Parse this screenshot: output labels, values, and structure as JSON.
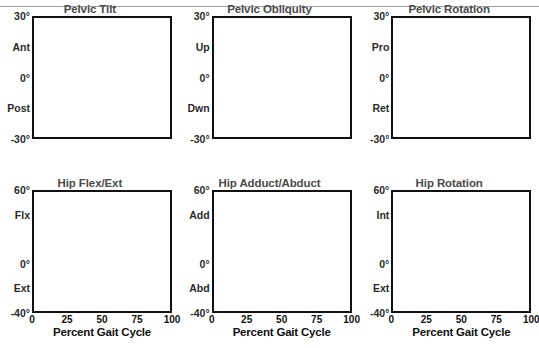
{
  "figure": {
    "title_bar_visible": true,
    "background": "#ffffff",
    "band_color": "#8c8c8c",
    "band_edge_color": "#6e6e6e",
    "mean_line_color": "#555555",
    "patient_line_color": "#111111",
    "grid_color": "#b4b4b4",
    "zero_line_color": "#111111",
    "event_line_solid_color": "#8a8a8a",
    "event_line_dashed_color": "#777777",
    "axis_color": "#111111",
    "title_color": "#4a4a4a"
  },
  "xaxis": {
    "title": "Percent Gait Cycle",
    "ticks": [
      0,
      25,
      50,
      75,
      100
    ],
    "tick_labels": [
      "0",
      "25",
      "50",
      "75",
      "100"
    ],
    "min": 0,
    "max": 100
  },
  "events": {
    "solid_vertical_pct": 62,
    "dashed_vertical_pct": 64.5,
    "top_marks_pct": [
      15,
      17,
      49,
      51
    ]
  },
  "chart_data": [
    {
      "type": "line",
      "title": "Pelvic Tilt",
      "xlabel": "Percent Gait Cycle",
      "ylabel": "",
      "ylim": [
        -30,
        30
      ],
      "yticks": [
        -30,
        -15,
        0,
        15,
        30
      ],
      "ytick_labels": [
        "-30°",
        "Post",
        "0°",
        "Ant",
        "30°"
      ],
      "grid": true,
      "x": [
        0,
        5,
        10,
        15,
        20,
        25,
        30,
        35,
        40,
        45,
        50,
        55,
        60,
        65,
        70,
        75,
        80,
        85,
        90,
        95,
        100
      ],
      "series": [
        {
          "name": "Normal band upper",
          "values": [
            14.5,
            14.5,
            14.3,
            14.0,
            13.6,
            13.2,
            13.0,
            13.0,
            13.2,
            13.5,
            13.8,
            14.0,
            14.2,
            14.5,
            14.8,
            15.0,
            15.0,
            14.8,
            14.6,
            14.5,
            14.5
          ]
        },
        {
          "name": "Normal band lower",
          "values": [
            7.0,
            7.0,
            6.8,
            6.5,
            6.2,
            6.0,
            5.9,
            5.9,
            6.0,
            6.2,
            6.4,
            6.6,
            6.8,
            7.0,
            7.2,
            7.4,
            7.4,
            7.3,
            7.1,
            7.0,
            7.0
          ]
        },
        {
          "name": "Mean",
          "values": [
            11.0,
            11.0,
            10.7,
            10.3,
            10.0,
            9.7,
            9.5,
            9.5,
            9.7,
            10.0,
            10.2,
            10.4,
            10.6,
            10.9,
            11.1,
            11.3,
            11.3,
            11.2,
            11.0,
            11.0,
            11.0
          ]
        },
        {
          "name": "Patient (dash-dot)",
          "values": [
            12.5,
            12.6,
            12.3,
            11.9,
            11.5,
            11.2,
            11.0,
            11.0,
            11.2,
            11.5,
            11.8,
            12.1,
            12.4,
            12.7,
            12.9,
            13.0,
            12.9,
            12.7,
            12.5,
            12.4,
            12.4
          ]
        }
      ]
    },
    {
      "type": "line",
      "title": "Pelvic Obliquity",
      "xlabel": "Percent Gait Cycle",
      "ylabel": "",
      "ylim": [
        -30,
        30
      ],
      "yticks": [
        -30,
        -15,
        0,
        15,
        30
      ],
      "ytick_labels": [
        "-30°",
        "Dwn",
        "0°",
        "Up",
        "30°"
      ],
      "grid": true,
      "x": [
        0,
        5,
        10,
        15,
        20,
        25,
        30,
        35,
        40,
        45,
        50,
        55,
        60,
        65,
        70,
        75,
        80,
        85,
        90,
        95,
        100
      ],
      "series": [
        {
          "name": "Normal band upper",
          "values": [
            2.0,
            2.2,
            2.0,
            1.3,
            0.4,
            -0.4,
            -1.0,
            -1.2,
            -0.9,
            -0.4,
            0.0,
            -0.6,
            -1.8,
            -3.0,
            -3.4,
            -2.6,
            -1.2,
            0.0,
            0.6,
            0.9,
            1.0
          ]
        },
        {
          "name": "Normal band lower",
          "values": [
            -0.8,
            -0.6,
            -0.9,
            -1.5,
            -2.3,
            -3.0,
            -3.5,
            -3.7,
            -3.4,
            -2.9,
            -2.6,
            -3.2,
            -4.4,
            -5.6,
            -6.0,
            -5.2,
            -3.8,
            -2.4,
            -1.7,
            -1.3,
            -1.2
          ]
        },
        {
          "name": "Mean",
          "values": [
            0.6,
            0.8,
            0.6,
            -0.1,
            -1.0,
            -1.7,
            -2.3,
            -2.5,
            -2.2,
            -1.7,
            -1.3,
            -1.9,
            -3.1,
            -4.3,
            -4.7,
            -3.9,
            -2.5,
            -1.2,
            -0.6,
            -0.2,
            -0.1
          ]
        },
        {
          "name": "Patient (dash-dot)",
          "values": [
            2.4,
            3.0,
            2.8,
            2.0,
            1.0,
            0.1,
            -0.6,
            -0.9,
            -0.6,
            -0.1,
            0.3,
            -0.4,
            -1.8,
            -3.2,
            -3.6,
            -2.7,
            -1.0,
            0.4,
            1.0,
            1.2,
            1.2
          ]
        }
      ]
    },
    {
      "type": "line",
      "title": "Pelvic Rotation",
      "xlabel": "Percent Gait Cycle",
      "ylabel": "",
      "ylim": [
        -30,
        30
      ],
      "yticks": [
        -30,
        -15,
        0,
        15,
        30
      ],
      "ytick_labels": [
        "-30°",
        "Ret",
        "0°",
        "Pro",
        "30°"
      ],
      "grid": true,
      "x": [
        0,
        5,
        10,
        15,
        20,
        25,
        30,
        35,
        40,
        45,
        50,
        55,
        60,
        65,
        70,
        75,
        80,
        85,
        90,
        95,
        100
      ],
      "series": [
        {
          "name": "Normal band upper",
          "values": [
            8.0,
            7.6,
            6.8,
            5.6,
            4.2,
            2.6,
            0.8,
            -1.2,
            -3.2,
            -4.8,
            -5.8,
            -6.4,
            -6.4,
            -5.6,
            -4.0,
            -1.6,
            1.2,
            4.0,
            6.2,
            7.6,
            8.2
          ]
        },
        {
          "name": "Normal band lower",
          "values": [
            1.5,
            1.0,
            0.2,
            -1.0,
            -2.6,
            -4.6,
            -6.8,
            -9.0,
            -11.0,
            -12.4,
            -13.2,
            -13.6,
            -13.4,
            -12.4,
            -10.4,
            -7.4,
            -4.0,
            -0.6,
            2.2,
            4.2,
            5.2
          ]
        },
        {
          "name": "Mean",
          "values": [
            4.5,
            4.0,
            3.2,
            2.0,
            0.4,
            -1.4,
            -3.4,
            -5.6,
            -7.6,
            -9.0,
            -9.8,
            -10.2,
            -10.0,
            -9.0,
            -7.0,
            -4.0,
            -0.8,
            2.2,
            4.6,
            6.2,
            6.8
          ]
        },
        {
          "name": "Patient (dash-dot)",
          "values": [
            5.0,
            5.4,
            5.6,
            5.4,
            4.8,
            3.8,
            2.6,
            1.4,
            0.4,
            -0.3,
            -0.8,
            -1.0,
            -1.0,
            -0.8,
            -0.4,
            0.4,
            1.6,
            3.0,
            4.2,
            5.0,
            5.4
          ]
        },
        {
          "name": "Patient (solid dark)",
          "values": [
            -0.4,
            -0.4,
            -0.5,
            -0.6,
            -0.8,
            -1.2,
            -2.0,
            -3.4,
            -5.2,
            -7.2,
            -9.0,
            -10.2,
            -10.8,
            -10.2,
            -8.4,
            -6.0,
            -3.8,
            -2.2,
            -1.2,
            -0.7,
            -0.5
          ]
        }
      ]
    },
    {
      "type": "line",
      "title": "Hip Flex/Ext",
      "xlabel": "Percent Gait Cycle",
      "ylabel": "",
      "ylim": [
        -40,
        60
      ],
      "yticks": [
        -40,
        -20,
        0,
        20,
        40,
        60
      ],
      "ytick_labels": [
        "-40°",
        "Ext",
        "0°",
        "",
        "Flx",
        "60°"
      ],
      "grid": true,
      "x": [
        0,
        5,
        10,
        15,
        20,
        25,
        30,
        35,
        40,
        45,
        50,
        55,
        60,
        65,
        70,
        75,
        80,
        85,
        90,
        95,
        100
      ],
      "series": [
        {
          "name": "Normal band upper",
          "values": [
            36,
            36,
            34,
            31,
            27,
            23,
            18,
            13,
            8,
            4,
            1,
            0,
            3,
            11,
            21,
            31,
            38,
            42,
            42,
            40,
            38
          ]
        },
        {
          "name": "Normal band lower",
          "values": [
            29,
            29,
            27,
            24,
            20,
            16,
            11,
            6,
            1,
            -3,
            -6,
            -7,
            -4,
            4,
            14,
            24,
            31,
            35,
            35,
            33,
            31
          ]
        },
        {
          "name": "Mean",
          "values": [
            32.5,
            32.5,
            30.5,
            27.5,
            23.5,
            19.5,
            14.5,
            9.5,
            4.5,
            0.5,
            -2.5,
            -3.5,
            -0.5,
            7.5,
            17.5,
            27.5,
            34.5,
            38.5,
            38.5,
            36.5,
            34.5
          ]
        },
        {
          "name": "Patient (dash-dot)",
          "values": [
            33,
            33,
            31,
            28,
            24,
            20,
            15,
            10,
            5,
            1,
            -2,
            -3,
            0,
            8,
            18,
            28,
            35,
            39,
            39,
            37,
            35
          ]
        }
      ]
    },
    {
      "type": "line",
      "title": "Hip Adduct/Abduct",
      "xlabel": "Percent Gait Cycle",
      "ylabel": "",
      "ylim": [
        -40,
        60
      ],
      "yticks": [
        -40,
        -20,
        0,
        20,
        40,
        60
      ],
      "ytick_labels": [
        "-40°",
        "Abd",
        "0°",
        "",
        "Add",
        "60°"
      ],
      "grid": true,
      "x": [
        0,
        5,
        10,
        15,
        20,
        25,
        30,
        35,
        40,
        45,
        50,
        55,
        60,
        65,
        70,
        75,
        80,
        85,
        90,
        95,
        100
      ],
      "series": [
        {
          "name": "Normal band upper",
          "values": [
            5.5,
            6.5,
            7.5,
            8.2,
            8.6,
            8.4,
            7.6,
            7.2,
            7.4,
            7.0,
            5.4,
            3.2,
            1.4,
            0.6,
            1.0,
            1.8,
            2.6,
            3.6,
            5.0,
            6.2,
            6.4
          ]
        },
        {
          "name": "Normal band lower",
          "values": [
            -0.4,
            -0.4,
            -0.3,
            -0.2,
            -0.2,
            -0.3,
            -0.5,
            -0.6,
            -0.6,
            -1.0,
            -2.0,
            -3.4,
            -4.4,
            -4.6,
            -4.0,
            -3.0,
            -2.2,
            -1.6,
            -1.0,
            -0.6,
            -0.5
          ]
        },
        {
          "name": "Mean",
          "values": [
            2.5,
            3.0,
            3.6,
            4.0,
            4.2,
            4.0,
            3.5,
            3.3,
            3.4,
            3.0,
            1.7,
            -0.1,
            -1.5,
            -2.0,
            -1.5,
            -0.6,
            0.2,
            1.0,
            2.0,
            2.8,
            3.0
          ]
        },
        {
          "name": "Patient (dash-dot)",
          "values": [
            1.0,
            2.0,
            3.2,
            4.4,
            5.2,
            5.4,
            5.0,
            4.8,
            5.0,
            4.6,
            3.2,
            1.2,
            -0.5,
            -1.2,
            -0.7,
            0.2,
            1.0,
            1.8,
            2.8,
            3.6,
            3.8
          ]
        },
        {
          "name": "Patient (solid dark)",
          "values": [
            -0.5,
            -0.5,
            -0.5,
            -0.5,
            -0.5,
            -0.5,
            -0.6,
            -0.7,
            -0.8,
            -1.2,
            -2.2,
            -3.6,
            -4.6,
            -4.8,
            -4.2,
            -3.2,
            -2.4,
            -1.8,
            -1.2,
            -0.8,
            -0.6
          ]
        }
      ]
    },
    {
      "type": "line",
      "title": "Hip Rotation",
      "xlabel": "Percent Gait Cycle",
      "ylabel": "",
      "ylim": [
        -40,
        60
      ],
      "yticks": [
        -40,
        -20,
        0,
        20,
        40,
        60
      ],
      "ytick_labels": [
        "-40°",
        "Ext",
        "0°",
        "",
        "Int",
        "60°"
      ],
      "grid": true,
      "x": [
        0,
        5,
        10,
        15,
        20,
        25,
        30,
        35,
        40,
        45,
        50,
        55,
        60,
        65,
        70,
        75,
        80,
        85,
        90,
        95,
        100
      ],
      "series": [
        {
          "name": "Normal band upper",
          "values": [
            0.5,
            0.8,
            0.6,
            0.0,
            -0.6,
            -0.4,
            0.8,
            2.0,
            2.6,
            2.6,
            2.0,
            0.8,
            -1.2,
            -2.6,
            -2.0,
            -0.4,
            0.8,
            1.6,
            1.8,
            1.4,
            0.8
          ]
        },
        {
          "name": "Normal band lower",
          "values": [
            -7.6,
            -7.4,
            -7.6,
            -8.2,
            -8.8,
            -8.8,
            -8.0,
            -7.2,
            -6.8,
            -6.8,
            -7.4,
            -8.4,
            -10.0,
            -11.0,
            -10.4,
            -9.2,
            -8.4,
            -8.0,
            -7.8,
            -7.8,
            -8.0
          ]
        },
        {
          "name": "Mean",
          "values": [
            -3.5,
            -3.3,
            -3.5,
            -4.1,
            -4.7,
            -4.6,
            -3.6,
            -2.6,
            -2.1,
            -2.1,
            -2.7,
            -3.8,
            -5.6,
            -6.8,
            -6.2,
            -4.8,
            -3.8,
            -3.2,
            -3.0,
            -3.2,
            -3.6
          ]
        },
        {
          "name": "Patient (dash-dot)",
          "values": [
            -1.8,
            -1.2,
            -1.4,
            -2.2,
            -3.2,
            -3.4,
            -2.8,
            -2.2,
            -2.0,
            -2.2,
            -3.0,
            -4.2,
            -5.8,
            -6.6,
            -5.0,
            -2.8,
            -1.8,
            -1.4,
            -1.6,
            -1.8,
            -2.0
          ]
        },
        {
          "name": "Patient (solid dark)",
          "values": [
            -6.6,
            -6.6,
            -6.6,
            -6.6,
            -6.6,
            -6.6,
            -6.6,
            -6.6,
            -6.6,
            -6.6,
            -6.6,
            -6.6,
            -6.6,
            -6.6,
            -6.6,
            -6.6,
            -6.6,
            -6.6,
            -6.6,
            -6.6,
            -6.6
          ]
        }
      ]
    }
  ]
}
